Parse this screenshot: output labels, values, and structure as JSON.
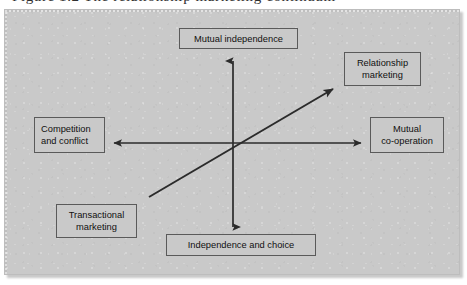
{
  "figure": {
    "caption_sliver": "Figure 1.2  The relationship marketing continuum",
    "panel_background_color": "#c9c9c9",
    "line_color": "#2b2b2b",
    "box_border_color": "#5a5a5a",
    "text_color": "#101010"
  },
  "axes": {
    "vertical": {
      "top_label": "Mutual independence",
      "bottom_label": "Independence and choice",
      "x": 228,
      "y_top": 51,
      "y_bottom": 217,
      "double_headed": true
    },
    "horizontal": {
      "left_label": "Competition and conflict",
      "right_label": "Mutual co-operation",
      "y": 133,
      "x_left": 109,
      "x_right": 356,
      "double_headed": true
    },
    "diagonal": {
      "from_label": "Transactional marketing",
      "to_label": "Relationship marketing",
      "x_tail": 144,
      "y_tail": 187,
      "x_head": 328,
      "y_head": 79,
      "double_headed": false
    }
  },
  "nodes": [
    {
      "id": "mutual-independence",
      "label": "Mutual independence",
      "align": "center"
    },
    {
      "id": "relationship-marketing",
      "label": "Relationship\nmarketing",
      "align": "center"
    },
    {
      "id": "competition-conflict",
      "label": "Competition\nand conflict",
      "align": "left"
    },
    {
      "id": "mutual-cooperation",
      "label": "Mutual\nco-operation",
      "align": "center"
    },
    {
      "id": "transactional-marketing",
      "label": "Transactional\nmarketing",
      "align": "center"
    },
    {
      "id": "independence-choice",
      "label": "Independence and choice",
      "align": "center"
    }
  ]
}
